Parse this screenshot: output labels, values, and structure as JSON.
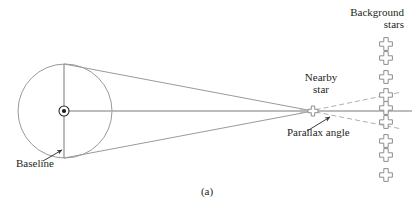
{
  "figure": {
    "panel_label": "(a)",
    "title_hint": "stellar-parallax-diagram",
    "colors": {
      "stroke": "#9a9a9a",
      "stroke_dark": "#6f6f6f",
      "text": "#231f20",
      "background": "#ffffff"
    }
  },
  "labels": {
    "background_stars": "Background\nstars",
    "nearby_star": "Nearby\nstar",
    "parallax_angle": "Parallax angle",
    "baseline": "Baseline"
  },
  "geometry": {
    "orbit_circle": {
      "cx": 65,
      "cy": 111,
      "r": 47
    },
    "sun_marker": {
      "cx": 64,
      "cy": 111,
      "outer_r": 5,
      "inner_r": 2
    },
    "baseline_segment": {
      "x": 64,
      "y_top": 64,
      "y_bottom": 158
    },
    "nearby_star": {
      "cx": 313,
      "cy": 111
    },
    "sight_lines": [
      {
        "x1": 64,
        "y1": 64,
        "x2": 313,
        "y2": 111
      },
      {
        "x1": 64,
        "y1": 158,
        "x2": 313,
        "y2": 111
      }
    ],
    "axis_line": {
      "x1": 64,
      "y1": 111,
      "x2": 410,
      "y2": 111
    },
    "dashed_lines": [
      {
        "x1": 313,
        "y1": 111,
        "x2": 400,
        "y2": 93
      },
      {
        "x1": 313,
        "y1": 111,
        "x2": 400,
        "y2": 127
      }
    ],
    "parallax_arrow": {
      "x1": 306,
      "y1": 130,
      "x2": 330,
      "y2": 117
    },
    "baseline_arrow": {
      "x1": 44,
      "y1": 160,
      "x2": 62,
      "y2": 150
    },
    "background_star_x": 386,
    "background_star_ys": [
      44,
      58,
      77,
      95,
      104,
      118,
      138,
      152,
      173
    ]
  }
}
